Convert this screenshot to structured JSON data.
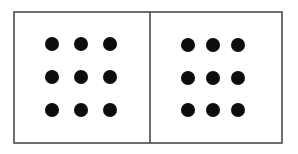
{
  "figure": {
    "canvas": {
      "width": 298,
      "height": 154,
      "background": "#ffffff"
    },
    "frame": {
      "x": 14,
      "y": 12,
      "width": 268,
      "height": 131,
      "stroke_color": "#4a4a4a",
      "stroke_width": 1.6,
      "fill": "#ffffff"
    },
    "divider": {
      "x": 150,
      "y_top": 12,
      "y_bottom": 143,
      "stroke_color": "#4a4a4a",
      "stroke_width": 1.6
    },
    "dot_style": {
      "color": "#0d0d0d",
      "radius": 7,
      "shape": "circle"
    },
    "panels": [
      {
        "name": "left-panel",
        "rows": 3,
        "columns": 3,
        "dot_count": 9,
        "column_centers_x": [
          52,
          81,
          110
        ],
        "row_centers_y": [
          44,
          77,
          110
        ],
        "dots": [
          {
            "cx": 52,
            "cy": 44,
            "r": 7
          },
          {
            "cx": 81,
            "cy": 44,
            "r": 7
          },
          {
            "cx": 110,
            "cy": 44,
            "r": 7
          },
          {
            "cx": 52,
            "cy": 77,
            "r": 7
          },
          {
            "cx": 81,
            "cy": 77,
            "r": 7
          },
          {
            "cx": 110,
            "cy": 77,
            "r": 7
          },
          {
            "cx": 52,
            "cy": 110,
            "r": 7
          },
          {
            "cx": 81,
            "cy": 110,
            "r": 7
          },
          {
            "cx": 110,
            "cy": 110,
            "r": 7
          }
        ]
      },
      {
        "name": "right-panel",
        "rows": 3,
        "columns": 3,
        "dot_count": 9,
        "column_centers_x": [
          188,
          213,
          238
        ],
        "row_centers_y": [
          45,
          78,
          110
        ],
        "dots": [
          {
            "cx": 188,
            "cy": 45,
            "r": 7
          },
          {
            "cx": 213,
            "cy": 45,
            "r": 7
          },
          {
            "cx": 238,
            "cy": 45,
            "r": 7
          },
          {
            "cx": 188,
            "cy": 78,
            "r": 7
          },
          {
            "cx": 213,
            "cy": 78,
            "r": 7
          },
          {
            "cx": 238,
            "cy": 78,
            "r": 7
          },
          {
            "cx": 188,
            "cy": 110,
            "r": 7
          },
          {
            "cx": 213,
            "cy": 110,
            "r": 7
          },
          {
            "cx": 238,
            "cy": 110,
            "r": 7
          }
        ]
      }
    ]
  }
}
